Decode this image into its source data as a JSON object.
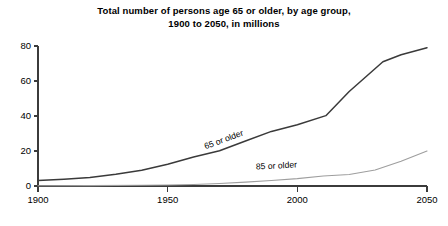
{
  "chart_data": {
    "type": "line",
    "title": "Total number of persons age 65 or older, by age group, 1900 to 2050, in millions",
    "title_lines": [
      "Total number of persons age 65 or older, by age group,",
      "1900 to 2050, in millions"
    ],
    "xlabel": "",
    "ylabel": "",
    "xlim": [
      1900,
      2050
    ],
    "ylim": [
      0,
      80
    ],
    "xticks": [
      1900,
      1950,
      2000,
      2050
    ],
    "xtick_labels": [
      "1900",
      "1950",
      "2000",
      "2050"
    ],
    "yticks": [
      0,
      20,
      40,
      60,
      80
    ],
    "ytick_labels": [
      "0",
      "20",
      "40",
      "60",
      "80"
    ],
    "grid": false,
    "legend_position": "inline-annotation",
    "series": [
      {
        "name": "65 or older",
        "label": "65 or older",
        "color": "#3a3a3a",
        "line_width": 1.5,
        "label_angle": -20,
        "label_x": 1972,
        "label_y": 25,
        "x": [
          1900,
          1910,
          1920,
          1930,
          1940,
          1950,
          1960,
          1970,
          1980,
          1990,
          2000,
          2011,
          2020,
          2033,
          2040,
          2050
        ],
        "values": [
          3.1,
          3.9,
          4.9,
          6.7,
          9.0,
          12.4,
          16.6,
          20.1,
          25.7,
          31.2,
          35.0,
          40.2,
          54.0,
          71.0,
          75.0,
          79.0
        ]
      },
      {
        "name": "85 or older",
        "label": "85 or older",
        "color": "#9e9e9e",
        "line_width": 1.1,
        "label_angle": -3,
        "label_x": 1992,
        "label_y": 10,
        "x": [
          1900,
          1920,
          1940,
          1950,
          1960,
          1970,
          1980,
          1990,
          2000,
          2010,
          2020,
          2030,
          2040,
          2050
        ],
        "values": [
          0.1,
          0.2,
          0.4,
          0.6,
          0.9,
          1.4,
          2.2,
          3.1,
          4.2,
          5.7,
          6.6,
          9.1,
          14.2,
          20.0
        ]
      }
    ]
  },
  "plot_geometry": {
    "left": 38,
    "right": 427,
    "top": 46,
    "bottom": 186,
    "tick_length": 4
  }
}
